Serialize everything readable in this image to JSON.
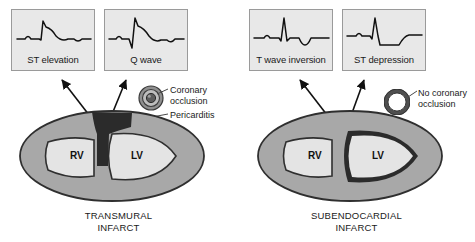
{
  "figure": {
    "panels": [
      {
        "id": "transmural",
        "caption_line1": "TRANSMURAL",
        "caption_line2": "INFARCT",
        "ecg_boxes": [
          {
            "label": "ST elevation",
            "trace": "st-elevation-waveform"
          },
          {
            "label": "Q wave",
            "trace": "q-wave-waveform"
          }
        ],
        "vessel": {
          "icon": "occluded-artery-icon",
          "label_line1": "Coronary",
          "label_line2": "occlusion"
        },
        "annotation": {
          "label": "Pericarditis",
          "target": "epicardial-surface"
        },
        "chambers": [
          {
            "label": "RV"
          },
          {
            "label": "LV"
          }
        ],
        "infarct": {
          "name": "transmural-infarct-region",
          "description": "full-thickness dark band through anterior wall and septum"
        }
      },
      {
        "id": "subendocardial",
        "caption_line1": "SUBENDOCARDIAL",
        "caption_line2": "INFARCT",
        "ecg_boxes": [
          {
            "label": "T wave inversion",
            "trace": "t-wave-inversion-waveform"
          },
          {
            "label": "ST depression",
            "trace": "st-depression-waveform"
          }
        ],
        "vessel": {
          "icon": "patent-artery-icon",
          "label_line1": "No coronary",
          "label_line2": "occlusion"
        },
        "chambers": [
          {
            "label": "RV"
          },
          {
            "label": "LV"
          }
        ],
        "infarct": {
          "name": "subendocardial-infarct-region",
          "description": "thin dark rim lining the inner left ventricular cavity"
        }
      }
    ]
  },
  "colors": {
    "myocardium": "#a8a8a8",
    "chamber": "#e4e4e4",
    "infarct": "#2b2b2b",
    "box_fill": "#e8e8e8",
    "box_border": "#9a9a9a",
    "trace": "#111111",
    "text": "#1a1a1a"
  }
}
